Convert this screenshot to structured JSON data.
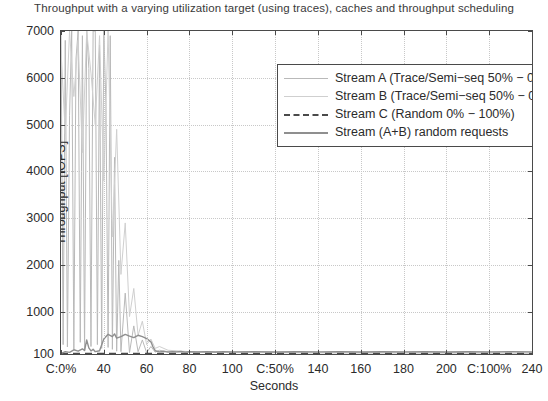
{
  "chart_data": {
    "type": "line",
    "title": "Throughput with a varying utilization target (using traces), caches and throughput scheduling",
    "xlabel": "Seconds",
    "ylabel": "Throughput [IOPS]",
    "xlim": [
      20,
      240
    ],
    "ylim": [
      100,
      7000
    ],
    "grid": true,
    "legend_position": "top-right",
    "xticks": [
      20,
      40,
      60,
      80,
      100,
      120,
      140,
      160,
      180,
      200,
      220,
      240
    ],
    "xticklabels": [
      "C:0%",
      "40",
      "60",
      "80",
      "100",
      "C:50%",
      "140",
      "160",
      "180",
      "200",
      "C:100%",
      "240"
    ],
    "yticks": [
      100,
      1000,
      2000,
      3000,
      4000,
      5000,
      6000,
      7000
    ],
    "yticklabels": [
      "100",
      "1000",
      "2000",
      "3000",
      "4000",
      "5000",
      "6000",
      "7000"
    ],
    "series": [
      {
        "name": "Stream A (Trace/Semi-seq 50% - 0%)",
        "color": "#b9b9b9",
        "style": "solid",
        "width": 1,
        "x": [
          20,
          21,
          22,
          23,
          24,
          25,
          26,
          27,
          28,
          29,
          30,
          31,
          32,
          33,
          34,
          35,
          36,
          37,
          38,
          39,
          40,
          41,
          42,
          43,
          44,
          45,
          46,
          47,
          48,
          50,
          52,
          54,
          56,
          58,
          60,
          62,
          64,
          66,
          70,
          80,
          90,
          100,
          120,
          140,
          160,
          180,
          200,
          220,
          240
        ],
        "y": [
          7000,
          300,
          6800,
          250,
          5200,
          7000,
          200,
          6400,
          7000,
          350,
          6900,
          180,
          7000,
          6200,
          260,
          7000,
          7000,
          300,
          6700,
          220,
          7000,
          5400,
          240,
          6900,
          200,
          4300,
          160,
          2100,
          150,
          1400,
          130,
          700,
          150,
          400,
          130,
          260,
          140,
          180,
          150,
          140,
          135,
          130,
          128,
          126,
          125,
          124,
          123,
          122,
          120
        ]
      },
      {
        "name": "Stream B (Trace/Semi-seq 50% - 0%)",
        "color": "#cfcfcf",
        "style": "solid",
        "width": 1,
        "x": [
          20,
          22,
          24,
          26,
          28,
          30,
          32,
          34,
          36,
          38,
          40,
          42,
          44,
          46,
          48,
          50,
          52,
          54,
          56,
          58,
          60,
          62,
          64,
          66,
          70,
          80,
          90,
          100,
          120,
          140,
          160,
          180,
          200,
          220,
          240
        ],
        "y": [
          6600,
          4800,
          7000,
          5600,
          6800,
          4400,
          7000,
          6100,
          5000,
          6900,
          3800,
          7000,
          2600,
          4900,
          1800,
          2900,
          900,
          1500,
          500,
          800,
          300,
          420,
          220,
          260,
          180,
          150,
          140,
          135,
          130,
          128,
          126,
          125,
          124,
          122,
          120
        ]
      },
      {
        "name": "Stream C (Random 0% - 100%)",
        "color": "#4a4a4a",
        "style": "dashed",
        "width": 1.6,
        "x": [
          20,
          240
        ],
        "y": [
          112,
          112
        ]
      },
      {
        "name": "Stream (A+B) random requests",
        "color": "#8f8f8f",
        "style": "solid",
        "width": 1.4,
        "x": [
          20,
          22,
          24,
          26,
          28,
          30,
          31,
          32,
          33,
          34,
          35,
          36,
          38,
          40,
          42,
          44,
          45,
          46,
          48,
          50,
          52,
          54,
          56,
          58,
          60,
          62,
          63,
          64,
          66,
          68,
          70,
          72,
          74,
          76,
          78,
          80,
          84,
          88,
          92,
          96,
          100,
          110,
          120,
          130,
          140,
          150,
          160,
          170,
          180,
          190,
          200,
          210,
          220,
          230,
          240
        ],
        "y": [
          110,
          150,
          135,
          190,
          160,
          210,
          175,
          400,
          230,
          165,
          200,
          150,
          170,
          420,
          520,
          470,
          530,
          440,
          470,
          520,
          480,
          450,
          500,
          470,
          430,
          360,
          250,
          170,
          145,
          155,
          140,
          150,
          145,
          155,
          140,
          150,
          145,
          150,
          142,
          150,
          145,
          150,
          142,
          148,
          145,
          150,
          143,
          148,
          145,
          150,
          143,
          148,
          145,
          150,
          145
        ]
      }
    ]
  },
  "legend": {
    "items": [
      {
        "label": "Stream A (Trace/Semi−seq 50% − 0%)",
        "color": "#b9b9b9",
        "style": "solid"
      },
      {
        "label": "Stream B (Trace/Semi−seq 50% − 0%)",
        "color": "#cfcfcf",
        "style": "solid"
      },
      {
        "label": "Stream C (Random 0% − 100%)",
        "color": "#4a4a4a",
        "style": "dashed"
      },
      {
        "label": "Stream (A+B) random requests",
        "color": "#8f8f8f",
        "style": "solid"
      }
    ]
  },
  "axes": {
    "title": "Throughput with a varying utilization target (using traces), caches and throughput scheduling",
    "y_axis_title": "Throughput [IOPS]",
    "x_axis_title": "Seconds"
  }
}
